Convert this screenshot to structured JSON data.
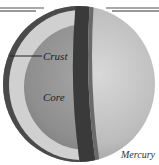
{
  "diagram": {
    "subject": "Mercury",
    "labels": {
      "crust": "Crust",
      "core": "Core",
      "planet": "Mercury"
    },
    "colors": {
      "background": "#ffffff",
      "core": "#8f8f8f",
      "crust": "#cfcfcf",
      "outer_rim": "#4a4a4a",
      "cut_band": "#3a3a3a",
      "surface": "#bdbdbd",
      "rule_lines": "#333333"
    }
  }
}
